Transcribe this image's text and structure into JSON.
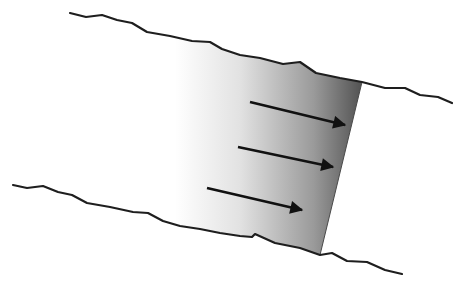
{
  "diagram": {
    "type": "flow-channel",
    "colors": {
      "background": "#ffffff",
      "boundary_line": "#1e1e1e",
      "arrow": "#111111",
      "gradient_start": "#ffffff",
      "gradient_end": "#555555"
    },
    "top_boundary": [
      [
        70,
        13
      ],
      [
        86,
        17
      ],
      [
        102,
        15
      ],
      [
        117,
        20
      ],
      [
        132,
        23
      ],
      [
        147,
        32
      ],
      [
        170,
        36
      ],
      [
        192,
        41
      ],
      [
        210,
        42
      ],
      [
        222,
        49
      ],
      [
        240,
        55
      ],
      [
        260,
        58
      ],
      [
        283,
        64
      ],
      [
        300,
        62
      ],
      [
        316,
        73
      ],
      [
        340,
        78
      ],
      [
        362,
        82
      ],
      [
        385,
        88
      ],
      [
        405,
        88
      ],
      [
        420,
        95
      ],
      [
        438,
        97
      ],
      [
        452,
        103
      ]
    ],
    "bottom_boundary": [
      [
        13,
        185
      ],
      [
        27,
        188
      ],
      [
        43,
        186
      ],
      [
        58,
        192
      ],
      [
        72,
        195
      ],
      [
        87,
        203
      ],
      [
        110,
        207
      ],
      [
        133,
        212
      ],
      [
        148,
        213
      ],
      [
        163,
        221
      ],
      [
        180,
        226
      ],
      [
        200,
        229
      ],
      [
        220,
        233
      ],
      [
        240,
        236
      ],
      [
        252,
        237
      ],
      [
        255,
        234
      ],
      [
        275,
        243
      ],
      [
        300,
        248
      ],
      [
        320,
        255
      ],
      [
        332,
        253
      ],
      [
        347,
        261
      ],
      [
        367,
        262
      ],
      [
        385,
        270
      ],
      [
        402,
        274
      ]
    ],
    "shaded_region": {
      "polygon": [
        [
          175,
          36
        ],
        [
          192,
          41
        ],
        [
          210,
          42
        ],
        [
          222,
          49
        ],
        [
          240,
          55
        ],
        [
          260,
          58
        ],
        [
          283,
          64
        ],
        [
          300,
          62
        ],
        [
          316,
          73
        ],
        [
          340,
          78
        ],
        [
          362,
          82
        ],
        [
          320,
          255
        ],
        [
          300,
          248
        ],
        [
          275,
          243
        ],
        [
          255,
          234
        ],
        [
          252,
          237
        ],
        [
          240,
          236
        ],
        [
          220,
          233
        ],
        [
          200,
          229
        ],
        [
          180,
          226
        ],
        [
          175,
          224
        ]
      ],
      "front_edge": [
        [
          362,
          82
        ],
        [
          320,
          255
        ]
      ]
    },
    "arrows": [
      {
        "from": [
          250,
          102
        ],
        "to": [
          345,
          125
        ]
      },
      {
        "from": [
          238,
          147
        ],
        "to": [
          333,
          167
        ]
      },
      {
        "from": [
          207,
          188
        ],
        "to": [
          302,
          210
        ]
      }
    ]
  }
}
